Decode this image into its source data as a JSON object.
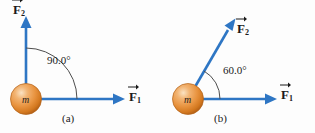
{
  "figure": {
    "background_color": "#fdfdfd",
    "arrow_color": "#2e76c4",
    "arc_color": "#4d4d4d",
    "text_color": "#1a1a1a",
    "sphere_color": "#e8933f",
    "sphere_highlight": "#f7d3a8",
    "sphere_edge": "#c06a20"
  },
  "panels": [
    {
      "id": "a",
      "caption": "(a)",
      "mass_label": "m",
      "angle": {
        "value": "90.0",
        "unit": "°",
        "text": "90.0°",
        "degrees": 90
      },
      "vectors": [
        {
          "name": "F1",
          "symbol": "F",
          "subscript": "1",
          "direction": "right",
          "angle_deg": 0
        },
        {
          "name": "F2",
          "symbol": "F",
          "subscript": "2",
          "direction": "up",
          "angle_deg": 90
        }
      ]
    },
    {
      "id": "b",
      "caption": "(b)",
      "mass_label": "m",
      "angle": {
        "value": "60.0",
        "unit": "°",
        "text": "60.0°",
        "degrees": 60
      },
      "vectors": [
        {
          "name": "F1",
          "symbol": "F",
          "subscript": "1",
          "direction": "right",
          "angle_deg": 0
        },
        {
          "name": "F2",
          "symbol": "F",
          "subscript": "2",
          "direction": "upper-right",
          "angle_deg": 60
        }
      ]
    }
  ]
}
